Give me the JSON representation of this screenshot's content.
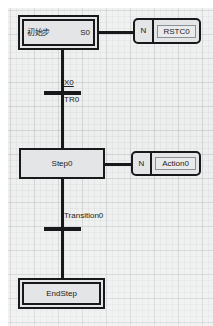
{
  "diagram": {
    "type": "sequential-function-chart",
    "title": "",
    "colors": {
      "canvas": "#eceded",
      "grid": "#a0a3a6",
      "line": "#18191a",
      "block_fill": "#e4e5e6",
      "page": "#ffffff"
    }
  },
  "steps": [
    {
      "id": "initial-step",
      "name": "初始步",
      "tag": "S0",
      "kind": "initial",
      "double_border": true
    },
    {
      "id": "step0",
      "name": "Step0",
      "tag": "",
      "kind": "step",
      "double_border": false
    },
    {
      "id": "end-step",
      "name": "EndStep",
      "tag": "",
      "kind": "end",
      "double_border": true
    }
  ],
  "actions": [
    {
      "id": "action-rstc0",
      "qualifier": "N",
      "name": "RSTC0",
      "attached_to": "initial-step"
    },
    {
      "id": "action-action0",
      "qualifier": "N",
      "name": "Action0",
      "attached_to": "step0"
    }
  ],
  "transitions": [
    {
      "id": "transition-tr0",
      "condition": "X0",
      "condition_underlined": true,
      "name": "TR0",
      "from": "initial-step",
      "to": "step0"
    },
    {
      "id": "transition-transition0",
      "condition": "",
      "condition_underlined": false,
      "name": "Transition0",
      "from": "step0",
      "to": "end-step"
    }
  ]
}
